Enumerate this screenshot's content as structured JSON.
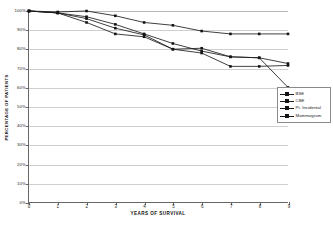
{
  "chart_data": {
    "type": "line",
    "title": "",
    "subtitle": "",
    "xlabel": "YEARS OF SURVIVAL",
    "ylabel": "PERCENTAGE OF PATIENTS",
    "x": [
      0,
      1,
      2,
      3,
      4,
      5,
      6,
      7,
      8,
      9
    ],
    "xlim": [
      0,
      9
    ],
    "ylim": [
      0,
      100
    ],
    "ytick_labels": [
      "0%",
      "10%",
      "20%",
      "30%",
      "40%",
      "50%",
      "60%",
      "70%",
      "80%",
      "90%",
      "100%"
    ],
    "ytick_values": [
      0,
      10,
      20,
      30,
      40,
      50,
      60,
      70,
      80,
      90,
      100
    ],
    "xtick_labels": [
      "0",
      "1",
      "2",
      "3",
      "4",
      "5",
      "6",
      "7",
      "8",
      "9"
    ],
    "grid": "horizontal",
    "legend_position": "right",
    "marker": "square",
    "series": [
      {
        "name": "BSE",
        "values": [
          100,
          99,
          96,
          91,
          87.5,
          80,
          80.5,
          76,
          75.5,
          72.5
        ]
      },
      {
        "name": "CBE",
        "values": [
          100,
          99,
          94,
          88,
          86.5,
          80,
          78,
          71,
          71,
          71.5
        ]
      },
      {
        "name": "Pt. Incidental",
        "values": [
          100,
          99,
          97,
          93,
          88,
          83,
          79,
          76,
          75.5,
          60
        ]
      },
      {
        "name": "Mammogram",
        "values": [
          100,
          99.5,
          100,
          97.5,
          94,
          92.5,
          89.5,
          88,
          88,
          88
        ]
      }
    ]
  },
  "legend": {
    "entries": [
      "BSE",
      "CBE",
      "Pt. Incidental",
      "Mammogram"
    ]
  },
  "colors": {
    "line": "#1d1d1d",
    "marker": "#141414",
    "grid": "#cfcfcf",
    "axis": "#666666",
    "background": "#ffffff"
  }
}
